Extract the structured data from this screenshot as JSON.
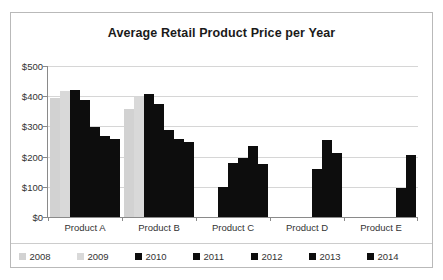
{
  "chart_data": {
    "type": "bar",
    "title": "Average Retail Product Price per Year",
    "xlabel": "",
    "ylabel": "",
    "ylim": [
      0,
      500
    ],
    "ytick_labels": [
      "$0",
      "$100",
      "$200",
      "$300",
      "$400",
      "$500"
    ],
    "ytick_values": [
      0,
      100,
      200,
      300,
      400,
      500
    ],
    "grid": true,
    "legend_position": "bottom",
    "categories": [
      "Product A",
      "Product B",
      "Product C",
      "Product D",
      "Product E"
    ],
    "series": [
      {
        "name": "2008",
        "color": "#d2d2d2",
        "values": [
          393,
          358,
          null,
          null,
          null
        ]
      },
      {
        "name": "2009",
        "color": "#d9d9d9",
        "values": [
          416,
          398,
          null,
          null,
          null
        ]
      },
      {
        "name": "2010",
        "color": "#0d0d0d",
        "values": [
          422,
          408,
          98,
          null,
          null
        ]
      },
      {
        "name": "2011",
        "color": "#0d0d0d",
        "values": [
          387,
          373,
          178,
          null,
          null
        ]
      },
      {
        "name": "2012",
        "color": "#0d0d0d",
        "values": [
          298,
          288,
          196,
          158,
          null
        ]
      },
      {
        "name": "2013",
        "color": "#0d0d0d",
        "values": [
          268,
          258,
          236,
          256,
          96
        ]
      },
      {
        "name": "2014",
        "color": "#0d0d0d",
        "values": [
          257,
          248,
          177,
          213,
          205
        ]
      }
    ]
  },
  "colors": {
    "gray_2008": "#d2d2d2",
    "gray_2009": "#d9d9d9",
    "black_series": "#0d0d0d",
    "gridline": "#d6d6d6",
    "axis": "#8a8a8a",
    "border": "#b9b9b9",
    "text": "#333333",
    "title_text": "#1a1a1a",
    "background": "#ffffff"
  }
}
